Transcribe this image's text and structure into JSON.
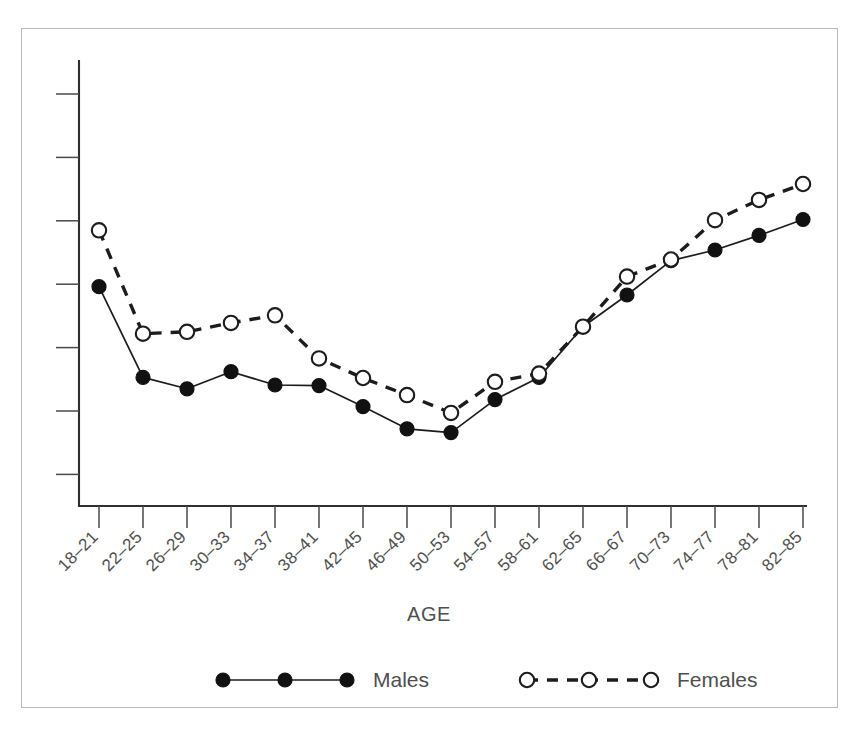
{
  "chart_data": {
    "type": "line",
    "title": "",
    "xlabel": "AGE",
    "ylabel": "",
    "grid": false,
    "legend_position": "bottom",
    "categories": [
      "18–21",
      "22–25",
      "26–29",
      "30–33",
      "34–37",
      "38–41",
      "42–45",
      "46–49",
      "50–53",
      "54–57",
      "58–61",
      "62–65",
      "66–67",
      "70–73",
      "74–77",
      "78–81",
      "82–85"
    ],
    "yaxis": {
      "labels_shown": false,
      "tick_count": 7,
      "ylim": [
        0,
        7
      ],
      "tick_values": [
        1,
        2,
        3,
        4,
        5,
        6,
        7
      ]
    },
    "series": [
      {
        "name": "Males",
        "marker": "filled-circle",
        "linestyle": "solid",
        "color": "#111111",
        "values": [
          3.96,
          2.53,
          2.35,
          2.62,
          2.41,
          2.4,
          2.07,
          1.72,
          1.66,
          2.18,
          2.53,
          3.33,
          3.83,
          4.37,
          4.54,
          4.77,
          5.02
        ]
      },
      {
        "name": "Females",
        "marker": "open-circle",
        "linestyle": "dashed",
        "color": "#111111",
        "values": [
          4.85,
          3.22,
          3.25,
          3.39,
          3.51,
          2.83,
          2.52,
          2.25,
          1.97,
          2.46,
          2.59,
          3.33,
          4.12,
          4.39,
          5.01,
          5.33,
          5.58
        ]
      }
    ],
    "legend": [
      {
        "label": "Males",
        "marker": "filled-circle",
        "linestyle": "solid"
      },
      {
        "label": "Females",
        "marker": "open-circle",
        "linestyle": "dashed"
      }
    ]
  }
}
